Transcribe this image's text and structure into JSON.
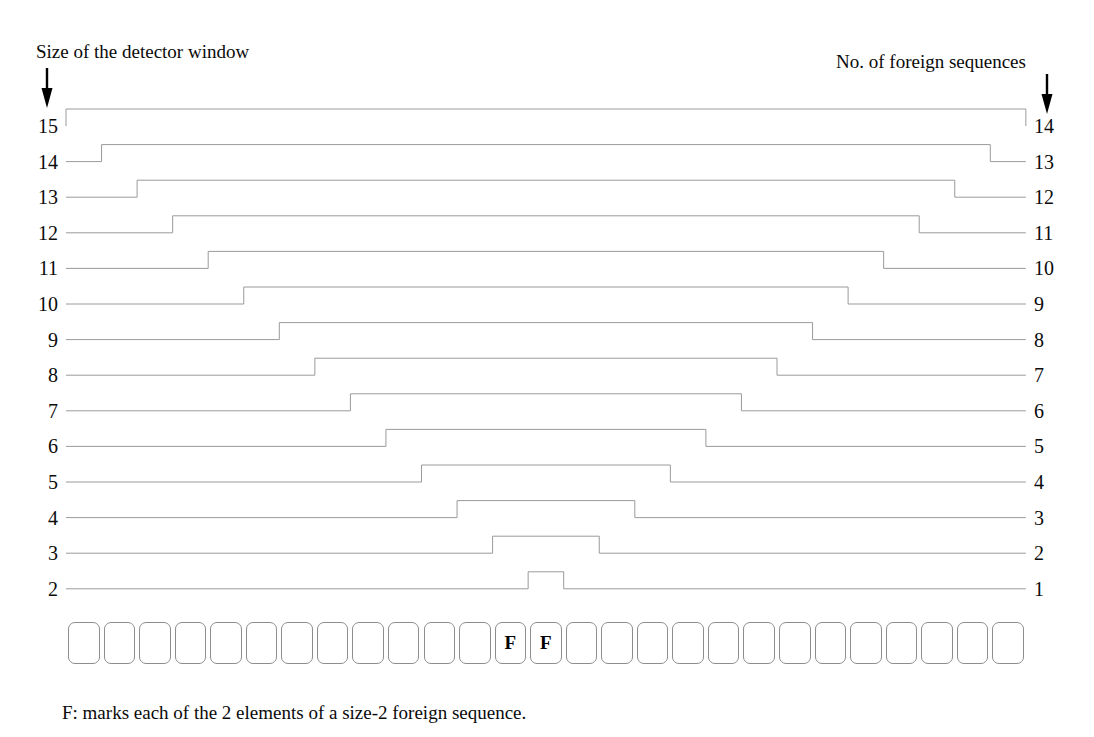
{
  "figure": {
    "left_header": "Size of the detector window",
    "right_header": "No. of foreign sequences",
    "footnote": "F: marks each of the 2 elements of a size-2 foreign sequence.",
    "left_arrow_icon": "down-arrow-icon",
    "right_arrow_icon": "down-arrow-icon",
    "line_color": "#9a9a9a",
    "text_color": "#000000",
    "box_border_color": "#8d8d8d"
  },
  "sequence_row": {
    "cell_count": 27,
    "foreign_marker": "F",
    "foreign_indices": [
      13,
      14
    ],
    "foreign_sequence_size": 2,
    "cells": [
      "",
      "",
      "",
      "",
      "",
      "",
      "",
      "",
      "",
      "",
      "",
      "",
      "F",
      "F",
      "",
      "",
      "",
      "",
      "",
      "",
      "",
      "",
      "",
      "",
      "",
      "",
      ""
    ]
  },
  "chart_data": {
    "type": "line",
    "title": "",
    "xlabel": "",
    "ylabel": "Size of the detector window",
    "y2label": "No. of foreign sequences",
    "left_axis_labels": [
      15,
      14,
      13,
      12,
      11,
      10,
      9,
      8,
      7,
      6,
      5,
      4,
      3,
      2
    ],
    "right_axis_labels": [
      14,
      13,
      12,
      11,
      10,
      9,
      8,
      7,
      6,
      5,
      4,
      3,
      2,
      1
    ],
    "grid": false,
    "legend": "none",
    "note": "Each trace is a step (plateau) whose raised span marks the detector-window placements that overlap the size-2 foreign sequence at cells 13-14; plateau width in cells equals window_size + 1, yielding window_size - 1 detections.",
    "series": [
      {
        "name": "window-15",
        "window_size": 15,
        "detections": 14,
        "plateau_start_cell": 0,
        "plateau_end_cell": 27
      },
      {
        "name": "window-14",
        "window_size": 14,
        "detections": 13,
        "plateau_start_cell": 1,
        "plateau_end_cell": 26
      },
      {
        "name": "window-13",
        "window_size": 13,
        "detections": 12,
        "plateau_start_cell": 2,
        "plateau_end_cell": 25
      },
      {
        "name": "window-12",
        "window_size": 12,
        "detections": 11,
        "plateau_start_cell": 3,
        "plateau_end_cell": 24
      },
      {
        "name": "window-11",
        "window_size": 11,
        "detections": 10,
        "plateau_start_cell": 4,
        "plateau_end_cell": 23
      },
      {
        "name": "window-10",
        "window_size": 10,
        "detections": 9,
        "plateau_start_cell": 5,
        "plateau_end_cell": 22
      },
      {
        "name": "window-9",
        "window_size": 9,
        "detections": 8,
        "plateau_start_cell": 6,
        "plateau_end_cell": 21
      },
      {
        "name": "window-8",
        "window_size": 8,
        "detections": 7,
        "plateau_start_cell": 7,
        "plateau_end_cell": 20
      },
      {
        "name": "window-7",
        "window_size": 7,
        "detections": 6,
        "plateau_start_cell": 8,
        "plateau_end_cell": 19
      },
      {
        "name": "window-6",
        "window_size": 6,
        "detections": 5,
        "plateau_start_cell": 9,
        "plateau_end_cell": 18
      },
      {
        "name": "window-5",
        "window_size": 5,
        "detections": 4,
        "plateau_start_cell": 10,
        "plateau_end_cell": 17
      },
      {
        "name": "window-4",
        "window_size": 4,
        "detections": 3,
        "plateau_start_cell": 11,
        "plateau_end_cell": 16
      },
      {
        "name": "window-3",
        "window_size": 3,
        "detections": 2,
        "plateau_start_cell": 12,
        "plateau_end_cell": 15
      },
      {
        "name": "window-2",
        "window_size": 2,
        "detections": 1,
        "plateau_start_cell": 13,
        "plateau_end_cell": 14
      }
    ]
  },
  "geometry": {
    "cell_x0": 66,
    "cell_w": 35.55,
    "row_y0": 126,
    "row_dy": 35.6,
    "plateau_rise": 17,
    "box_row_y": 622,
    "box_row_h": 42
  }
}
